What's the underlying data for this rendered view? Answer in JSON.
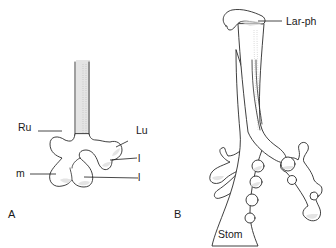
{
  "figure": {
    "panels": [
      {
        "id": "A",
        "panel_label": "A",
        "labels": {
          "right_upper": "Ru",
          "left_upper": "Lu",
          "left_lower_1": "l",
          "middle": "m",
          "left_lower_2": "l"
        }
      },
      {
        "id": "B",
        "panel_label": "B",
        "labels": {
          "laryngopharynx": "Lar-ph",
          "stomach": "Stom"
        }
      }
    ]
  }
}
